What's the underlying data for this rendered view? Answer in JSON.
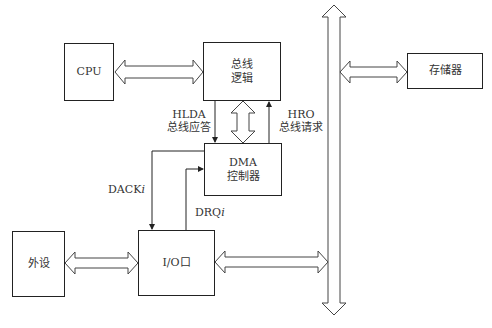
{
  "diagram": {
    "title": "",
    "nodes": {
      "cpu": {
        "label": "CPU"
      },
      "bus_logic": {
        "line1": "总线",
        "line2": "逻辑"
      },
      "dma": {
        "line1": "DMA",
        "line2": "控制器"
      },
      "io_port": {
        "label": "I/O口"
      },
      "peripheral": {
        "label": "外设"
      },
      "memory": {
        "label": "存储器"
      },
      "system_bus": {
        "label": ""
      }
    },
    "signals": {
      "hlda": {
        "line1": "HLDA",
        "line2": "总线应答"
      },
      "hrq": {
        "line1": "HRO",
        "line2": "总线请求"
      },
      "dack": {
        "prefix": "DACK",
        "suffix": "i"
      },
      "drq": {
        "prefix": "DRQ",
        "suffix": "i"
      }
    },
    "edges": [
      {
        "from": "cpu",
        "to": "bus_logic",
        "type": "bidirectional-bus"
      },
      {
        "from": "bus_logic",
        "to": "dma",
        "type": "bidirectional-bus"
      },
      {
        "from": "bus_logic",
        "to": "dma",
        "type": "signal",
        "label": "HLDA 总线应答"
      },
      {
        "from": "dma",
        "to": "bus_logic",
        "type": "signal",
        "label": "HRO 总线请求"
      },
      {
        "from": "dma",
        "to": "io_port",
        "type": "signal",
        "label": "DACKi"
      },
      {
        "from": "io_port",
        "to": "dma",
        "type": "signal",
        "label": "DRQi"
      },
      {
        "from": "peripheral",
        "to": "io_port",
        "type": "bidirectional-bus"
      },
      {
        "from": "io_port",
        "to": "system_bus",
        "type": "bidirectional-bus"
      },
      {
        "from": "system_bus",
        "to": "memory",
        "type": "bidirectional-bus"
      },
      {
        "from": "bus_logic",
        "to": "system_bus",
        "type": "bidirectional-bus"
      }
    ],
    "colors": {
      "stroke": "#222222",
      "text": "#333333",
      "background": "#ffffff"
    }
  }
}
